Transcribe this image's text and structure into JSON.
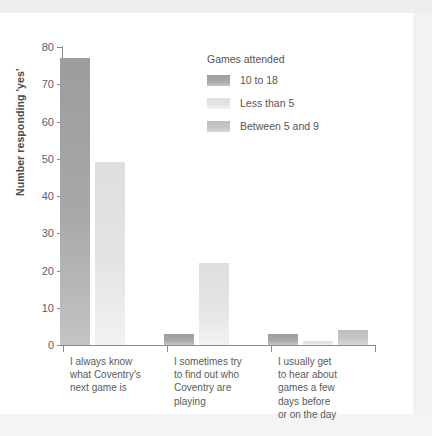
{
  "chart_data": {
    "type": "bar",
    "title": "",
    "xlabel": "",
    "ylabel": "Number responding 'yes'",
    "ylim": [
      0,
      80
    ],
    "yticks": [
      0,
      10,
      20,
      30,
      40,
      50,
      60,
      70,
      80
    ],
    "grid": false,
    "legend_position": "inside-top-right",
    "legend_title": "Games attended",
    "categories": [
      "I always know\nwhat Coventry's\nnext game is",
      "I sometimes try\nto find out who\nCoventry are\nplaying",
      "I usually get\nto hear about\ngames a few\ndays before\nor on the day"
    ],
    "series": [
      {
        "name": "10 to 18",
        "color": "#a3a3a3",
        "values": [
          77,
          3,
          3
        ]
      },
      {
        "name": "Less than 5",
        "color": "#e3e3e3",
        "values": [
          49,
          22,
          1
        ]
      },
      {
        "name": "Between 5 and 9",
        "color": "#c2c2c2",
        "values": [
          0,
          0,
          4
        ]
      }
    ]
  },
  "legend": {
    "title": "Games attended",
    "items": [
      {
        "label": "10 to 18",
        "color": "#a3a3a3"
      },
      {
        "label": "Less than 5",
        "color": "#e3e3e3"
      },
      {
        "label": "Between 5 and 9",
        "color": "#c2c2c2"
      }
    ]
  },
  "axes": {
    "y_title": "Number responding 'yes'",
    "y_ticks": [
      "80",
      "70",
      "60",
      "50",
      "40",
      "30",
      "20",
      "10",
      "0"
    ]
  },
  "categories": [
    "I always know\nwhat Coventry's\nnext game is",
    "I sometimes try\nto find out who\nCoventry are\nplaying",
    "I usually get\nto hear about\ngames a few\ndays before\nor on the day"
  ],
  "footer": {
    "ghost_text": ""
  }
}
